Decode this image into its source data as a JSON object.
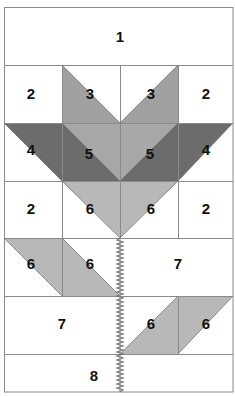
{
  "diagram": {
    "colors": {
      "background": "#ffffff",
      "grid_line": "#8a8a8a",
      "light_gray": "#b8b8b8",
      "medium_gray": "#9c9c9c",
      "dark_gray": "#6c6c6c",
      "stem": "#777777"
    },
    "grid": {
      "columns_x": [
        4,
        62,
        120,
        178,
        233
      ],
      "rows_y": [
        7,
        65,
        123,
        181,
        238,
        296,
        354,
        392
      ]
    },
    "pieces": [
      {
        "id": "p1",
        "label": "1",
        "row": 1,
        "desc": "full-width white strip"
      },
      {
        "id": "p2a",
        "label": "2",
        "row": 2,
        "col": 1
      },
      {
        "id": "p3a",
        "label": "3",
        "row": 2,
        "col": 2
      },
      {
        "id": "p3b",
        "label": "3",
        "row": 2,
        "col": 3
      },
      {
        "id": "p2b",
        "label": "2",
        "row": 2,
        "col": 4
      },
      {
        "id": "p4a",
        "label": "4",
        "row": 3,
        "col": 1
      },
      {
        "id": "p5a",
        "label": "5",
        "row": 3,
        "col": 2
      },
      {
        "id": "p5b",
        "label": "5",
        "row": 3,
        "col": 3
      },
      {
        "id": "p4b",
        "label": "4",
        "row": 3,
        "col": 4
      },
      {
        "id": "p2c",
        "label": "2",
        "row": 4,
        "col": 1
      },
      {
        "id": "p6a",
        "label": "6",
        "row": 4,
        "col": 2
      },
      {
        "id": "p6b",
        "label": "6",
        "row": 4,
        "col": 3
      },
      {
        "id": "p2d",
        "label": "2",
        "row": 4,
        "col": 4
      },
      {
        "id": "p6c",
        "label": "6",
        "row": 5,
        "col": 1
      },
      {
        "id": "p6d",
        "label": "6",
        "row": 5,
        "col": 2
      },
      {
        "id": "p7a",
        "label": "7",
        "row": 5,
        "desc": "right half white"
      },
      {
        "id": "p7b",
        "label": "7",
        "row": 6,
        "desc": "left half white"
      },
      {
        "id": "p6e",
        "label": "6",
        "row": 6,
        "col": 3
      },
      {
        "id": "p6f",
        "label": "6",
        "row": 6,
        "col": 4
      },
      {
        "id": "p8",
        "label": "8",
        "row": 7,
        "desc": "bottom strip"
      }
    ],
    "labels": {
      "p1": "1",
      "p2a": "2",
      "p3a": "3",
      "p3b": "3",
      "p2b": "2",
      "p4a": "4",
      "p5a": "5",
      "p5b": "5",
      "p4b": "4",
      "p2c": "2",
      "p6a": "6",
      "p6b": "6",
      "p2d": "2",
      "p6c": "6",
      "p6d": "6",
      "p7a": "7",
      "p7b": "7",
      "p6e": "6",
      "p6f": "6",
      "p8": "8"
    },
    "stem": {
      "type": "zigzag-stitch",
      "x": 120,
      "from_y": 181,
      "to_y": 392
    }
  }
}
